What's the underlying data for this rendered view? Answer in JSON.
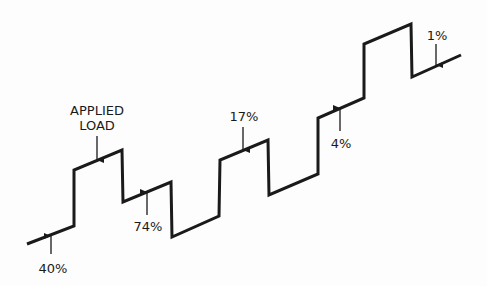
{
  "diagram": {
    "type": "stepped load trace",
    "stroke_color": "#1a1a1a",
    "background": "#fdfdfd",
    "path_points": [
      [
        27,
        244
      ],
      [
        74,
        226
      ],
      [
        74,
        170
      ],
      [
        122,
        150
      ],
      [
        123,
        202
      ],
      [
        171,
        182
      ],
      [
        172,
        237
      ],
      [
        219,
        216
      ],
      [
        220,
        160
      ],
      [
        268,
        140
      ],
      [
        269,
        195
      ],
      [
        318,
        174
      ],
      [
        318,
        118
      ],
      [
        364,
        98
      ],
      [
        364,
        44
      ],
      [
        411,
        24
      ],
      [
        412,
        77
      ],
      [
        461,
        55
      ]
    ],
    "labels": [
      {
        "id": "applied-load-line1",
        "text": "APPLIED",
        "x": 97,
        "y": 115
      },
      {
        "id": "applied-load-line2",
        "text": "LOAD",
        "x": 97,
        "y": 130
      },
      {
        "id": "pct-40",
        "text": "40%",
        "x": 53,
        "y": 273
      },
      {
        "id": "pct-74",
        "text": "74%",
        "x": 148,
        "y": 231
      },
      {
        "id": "pct-17",
        "text": "17%",
        "x": 244,
        "y": 121
      },
      {
        "id": "pct-4",
        "text": "4%",
        "x": 341,
        "y": 148
      },
      {
        "id": "pct-1",
        "text": "1%",
        "x": 437,
        "y": 40
      }
    ],
    "arrows": [
      {
        "id": "arrow-applied-load",
        "x": 97,
        "from_y": 136,
        "to_y": 160,
        "direction": "down"
      },
      {
        "id": "arrow-40",
        "x": 51,
        "from_y": 254,
        "to_y": 236,
        "direction": "up"
      },
      {
        "id": "arrow-74",
        "x": 147,
        "from_y": 215,
        "to_y": 192,
        "direction": "up"
      },
      {
        "id": "arrow-17",
        "x": 243,
        "from_y": 127,
        "to_y": 150,
        "direction": "down"
      },
      {
        "id": "arrow-4",
        "x": 340,
        "from_y": 131,
        "to_y": 108,
        "direction": "up"
      },
      {
        "id": "arrow-1",
        "x": 436,
        "from_y": 44,
        "to_y": 65,
        "direction": "down"
      }
    ]
  },
  "text": {
    "applied_line1": "APPLIED",
    "applied_line2": "LOAD",
    "p40": "40%",
    "p74": "74%",
    "p17": "17%",
    "p4": "4%",
    "p1": "1%"
  }
}
